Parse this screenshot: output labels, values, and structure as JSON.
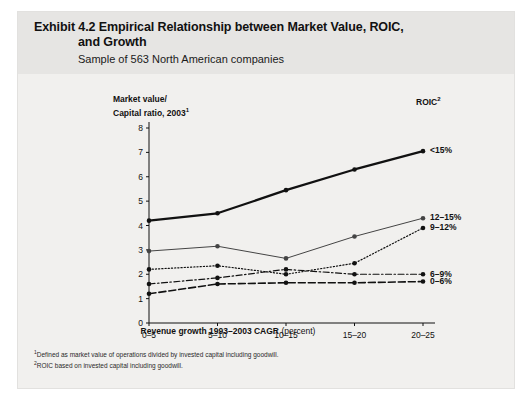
{
  "exhibit": {
    "title_line1": "Exhibit 4.2 Empirical Relationship between Market Value, ROIC,",
    "title_line2": "and Growth",
    "subtitle": "Sample of 563 North American companies",
    "legend_header": "ROIC",
    "legend_header_sup": "2",
    "footnote1": "Defined as market value of operations divided by invested capital including goodwill.",
    "footnote1_marker": "1",
    "footnote2": "ROIC based on invested capital including goodwill.",
    "footnote2_marker": "2"
  },
  "chart_data": {
    "type": "line",
    "title": "Exhibit 4.2 Empirical Relationship between Market Value, ROIC, and Growth",
    "subtitle": "Sample of 563 North American companies",
    "xlabel_bold": "Revenue growth 1993–2003 CAGR",
    "xlabel_plain": "(percent)",
    "ylabel_line1": "Market value/",
    "ylabel_line2": "Capital ratio, 2003",
    "ylabel_sup": "1",
    "categories": [
      "0–5",
      "5–10",
      "10–15",
      "15–20",
      "20–25"
    ],
    "ylim": [
      0,
      8
    ],
    "yticks": [
      0,
      1,
      2,
      3,
      4,
      5,
      6,
      7,
      8
    ],
    "grid": false,
    "legend_position": "right",
    "series": [
      {
        "name": "<15%",
        "values": [
          4.2,
          4.5,
          5.45,
          6.3,
          7.05
        ],
        "style": "solid-thick",
        "color": "#111111"
      },
      {
        "name": "12–15%",
        "values": [
          2.95,
          3.15,
          2.65,
          3.55,
          4.3
        ],
        "style": "solid-thin",
        "color": "#444444"
      },
      {
        "name": "9–12%",
        "values": [
          2.2,
          2.35,
          2.0,
          2.45,
          3.9
        ],
        "style": "dotted",
        "color": "#111111"
      },
      {
        "name": "6–9%",
        "values": [
          1.6,
          1.85,
          2.2,
          2.0,
          2.0
        ],
        "style": "dash-dot",
        "color": "#111111"
      },
      {
        "name": "0–6%",
        "values": [
          1.2,
          1.6,
          1.65,
          1.65,
          1.7
        ],
        "style": "dashed",
        "color": "#111111"
      }
    ]
  }
}
